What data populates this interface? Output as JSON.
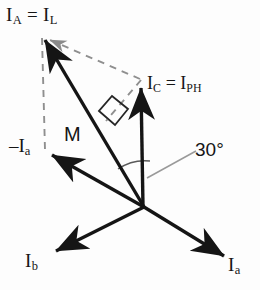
{
  "diagram": {
    "title_present": false,
    "background_color": "#fdfdfd",
    "line_color": "#151515",
    "dashed_color": "#8f8f8f",
    "leader_color": "#9a9a9a",
    "origin": {
      "x": 144,
      "y": 207
    },
    "labels": {
      "armature_current": {
        "text_main": "I",
        "sub_main": "A",
        "equals": " = ",
        "text_second": "I",
        "sub_second": "L"
      },
      "phase_current": {
        "text_main": "I",
        "sub_main": "C",
        "equals": " = ",
        "text_second": "I",
        "sub_second": "PH"
      },
      "resultant": {
        "text": "M"
      },
      "angle": {
        "text": "30°",
        "value": 30,
        "unit": "degrees"
      },
      "negative_phase_a": {
        "sign": "–",
        "text_main": "I",
        "sub_main": "a"
      },
      "phase_b": {
        "text_main": "I",
        "sub_main": "b"
      },
      "phase_a": {
        "text_main": "I",
        "sub_main": "a"
      }
    },
    "vectors": [
      {
        "name": "I_A = I_L",
        "from": [
          144,
          207
        ],
        "to": [
          43,
          37
        ],
        "style": "solid",
        "arrow": true
      },
      {
        "name": "I_C = I_PH",
        "from": [
          144,
          207
        ],
        "to": [
          141,
          84
        ],
        "style": "solid",
        "arrow": true
      },
      {
        "name": "-I_a",
        "from": [
          144,
          207
        ],
        "to": [
          48,
          152
        ],
        "style": "solid",
        "arrow": true
      },
      {
        "name": "I_b",
        "from": [
          144,
          207
        ],
        "to": [
          52,
          253
        ],
        "style": "solid",
        "arrow": true
      },
      {
        "name": "I_a",
        "from": [
          144,
          207
        ],
        "to": [
          228,
          258
        ],
        "style": "solid",
        "arrow": true
      }
    ],
    "construction_lines": [
      {
        "name": "parallelogram-diagonal",
        "from": [
          43,
          37
        ],
        "to": [
          140,
          79
        ],
        "style": "dashed",
        "arrow_at_start": true
      },
      {
        "name": "vertical-drop",
        "from": [
          42,
          37
        ],
        "to": [
          45,
          150
        ],
        "style": "dashed",
        "arrow": false
      },
      {
        "name": "perpendicular-foot",
        "from": [
          140,
          79
        ],
        "to": [
          104,
          123
        ],
        "style": "dashed",
        "arrow": false
      }
    ],
    "markers": [
      {
        "name": "right-angle-square",
        "at": [
          112,
          116
        ],
        "type": "square"
      },
      {
        "name": "angle-arc-30",
        "center": [
          144,
          207
        ],
        "radius": 46,
        "between": [
          "I_A",
          "I_C"
        ]
      },
      {
        "name": "angle-leader-line",
        "from": [
          150,
          178
        ],
        "to": [
          193,
          152
        ]
      }
    ]
  }
}
